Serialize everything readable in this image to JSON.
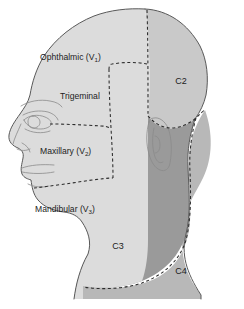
{
  "figure": {
    "background_color": "#ffffff",
    "width": 244,
    "height": 309
  },
  "palette": {
    "face_fill": "#dcdcdc",
    "scalp_c2_fill": "#c9c9c9",
    "c3_fill": "#9a9a9a",
    "c4_fill": "#b8b8b8",
    "outline_stroke": "#595959",
    "boundary_stroke": "#2b2b2b",
    "label_color": "#1c1c1c",
    "feature_stroke": "#8a8a8a"
  },
  "labels": {
    "ophthalmic": {
      "text": "Ophthalmic (V",
      "subscript": "1",
      "closing": ")",
      "x": 40,
      "y": 58
    },
    "trigeminal": {
      "text": "Trigeminal",
      "x": 60,
      "y": 97
    },
    "maxillary": {
      "text": "Maxillary (V",
      "subscript": "2",
      "closing": ")",
      "x": 40,
      "y": 152
    },
    "mandibular": {
      "text": "Mandibular (V",
      "subscript": "3",
      "closing": ")",
      "x": 35,
      "y": 210
    },
    "c2": {
      "text": "C2",
      "x": 181,
      "y": 82
    },
    "c3": {
      "text": "C3",
      "x": 118,
      "y": 247
    },
    "c4": {
      "text": "C4",
      "x": 181,
      "y": 272
    }
  },
  "regions": [
    {
      "id": "ophthalmic",
      "name": "Ophthalmic division V1",
      "fill": "#dcdcdc"
    },
    {
      "id": "maxillary",
      "name": "Maxillary division V2",
      "fill": "#dcdcdc"
    },
    {
      "id": "mandibular",
      "name": "Mandibular division V3",
      "fill": "#dcdcdc"
    },
    {
      "id": "c2",
      "name": "C2 dermatome",
      "fill": "#c9c9c9"
    },
    {
      "id": "c3",
      "name": "C3 dermatome",
      "fill": "#9a9a9a"
    },
    {
      "id": "c4",
      "name": "C4 dermatome",
      "fill": "#b8b8b8"
    }
  ]
}
